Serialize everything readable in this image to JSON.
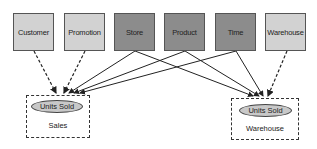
{
  "dimensions": [
    {
      "label": "Customer",
      "shade": "light",
      "x": 13
    },
    {
      "label": "Promotion",
      "shade": "light",
      "x": 64
    },
    {
      "label": "Store",
      "shade": "dark",
      "x": 114
    },
    {
      "label": "Product",
      "shade": "dark",
      "x": 164
    },
    {
      "label": "Time",
      "shade": "dark",
      "x": 215
    },
    {
      "label": "Warehouse",
      "shade": "light",
      "x": 265
    }
  ],
  "facts": [
    {
      "measure": "Units Sold",
      "label": "Sales"
    },
    {
      "measure": "Units Sold",
      "label": "Warehouse"
    }
  ],
  "colors": {
    "light_box": "#d2d2d2",
    "dark_box": "#8c8c8c",
    "ellipse": "#c8c8c8",
    "line": "#222222"
  }
}
